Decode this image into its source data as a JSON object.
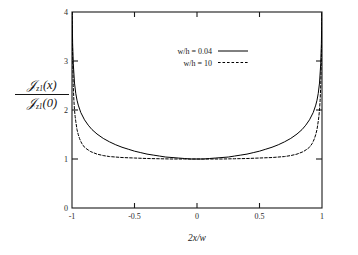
{
  "chart_data": {
    "type": "line",
    "title": "",
    "xlabel": "2x/w",
    "ylabel_numerator": "J_z1(x)",
    "ylabel_denominator": "J_z1(0)",
    "xlim": [
      -1,
      1
    ],
    "ylim": [
      0,
      4
    ],
    "xticks": [
      -1,
      -0.5,
      0,
      0.5,
      1
    ],
    "xtick_labels": [
      "-1",
      "-0.5",
      "0",
      "0.5",
      "1"
    ],
    "yticks": [
      0,
      1,
      2,
      3,
      4
    ],
    "ytick_labels": [
      "0",
      "1",
      "2",
      "3",
      "4"
    ],
    "grid": false,
    "legend_position": "top-center",
    "series": [
      {
        "name": "w/h = 0.04",
        "style": "solid",
        "color": "#000000",
        "x": [
          -0.999,
          -0.995,
          -0.99,
          -0.98,
          -0.97,
          -0.96,
          -0.95,
          -0.93,
          -0.9,
          -0.87,
          -0.84,
          -0.8,
          -0.75,
          -0.7,
          -0.65,
          -0.6,
          -0.55,
          -0.5,
          -0.45,
          -0.4,
          -0.35,
          -0.3,
          -0.25,
          -0.2,
          -0.15,
          -0.1,
          -0.05,
          0,
          0.05,
          0.1,
          0.15,
          0.2,
          0.25,
          0.3,
          0.35,
          0.4,
          0.45,
          0.5,
          0.55,
          0.6,
          0.65,
          0.7,
          0.75,
          0.8,
          0.84,
          0.87,
          0.9,
          0.93,
          0.95,
          0.96,
          0.97,
          0.98,
          0.99,
          0.995,
          0.999
        ],
        "y": [
          4.0,
          3.35,
          2.95,
          2.55,
          2.34,
          2.2,
          2.1,
          1.95,
          1.8,
          1.69,
          1.6,
          1.51,
          1.42,
          1.35,
          1.29,
          1.24,
          1.2,
          1.16,
          1.13,
          1.1,
          1.08,
          1.06,
          1.04,
          1.03,
          1.02,
          1.01,
          1.0,
          1.0,
          1.0,
          1.01,
          1.02,
          1.03,
          1.04,
          1.06,
          1.08,
          1.1,
          1.13,
          1.16,
          1.2,
          1.24,
          1.29,
          1.35,
          1.42,
          1.51,
          1.6,
          1.69,
          1.8,
          1.95,
          2.1,
          2.2,
          2.34,
          2.55,
          2.95,
          3.35,
          4.0
        ]
      },
      {
        "name": "w/h = 10",
        "style": "dashed",
        "color": "#000000",
        "x": [
          -0.999,
          -0.997,
          -0.995,
          -0.99,
          -0.985,
          -0.98,
          -0.975,
          -0.97,
          -0.96,
          -0.95,
          -0.94,
          -0.93,
          -0.92,
          -0.9,
          -0.88,
          -0.85,
          -0.8,
          -0.75,
          -0.7,
          -0.6,
          -0.5,
          -0.4,
          -0.3,
          -0.2,
          -0.1,
          0,
          0.1,
          0.2,
          0.3,
          0.4,
          0.5,
          0.6,
          0.7,
          0.75,
          0.8,
          0.85,
          0.88,
          0.9,
          0.92,
          0.93,
          0.94,
          0.95,
          0.96,
          0.97,
          0.975,
          0.98,
          0.985,
          0.99,
          0.995,
          0.997,
          0.999
        ],
        "y": [
          4.0,
          3.45,
          3.1,
          2.5,
          2.2,
          2.0,
          1.87,
          1.77,
          1.6,
          1.5,
          1.42,
          1.36,
          1.31,
          1.24,
          1.2,
          1.15,
          1.1,
          1.07,
          1.05,
          1.03,
          1.02,
          1.01,
          1.005,
          1.0,
          1.0,
          1.0,
          1.0,
          1.0,
          1.005,
          1.01,
          1.02,
          1.03,
          1.05,
          1.07,
          1.1,
          1.15,
          1.2,
          1.24,
          1.31,
          1.36,
          1.42,
          1.5,
          1.6,
          1.77,
          1.87,
          2.0,
          2.2,
          2.5,
          3.1,
          3.45,
          4.0
        ]
      }
    ]
  },
  "legend": {
    "entries": [
      {
        "label": "w/h = 0.04",
        "style": "solid"
      },
      {
        "label": "w/h = 10",
        "style": "dashed"
      }
    ]
  },
  "axes": {
    "x_title": "2x/w",
    "y_numerator_main": "J",
    "y_numerator_sub": "z1",
    "y_numerator_arg": "(x)",
    "y_denominator_main": "J",
    "y_denominator_sub": "z1",
    "y_denominator_arg": "(0)"
  },
  "style": {
    "background": "#ffffff",
    "axis_color": "#1a1a1a",
    "curve_color": "#000000"
  }
}
